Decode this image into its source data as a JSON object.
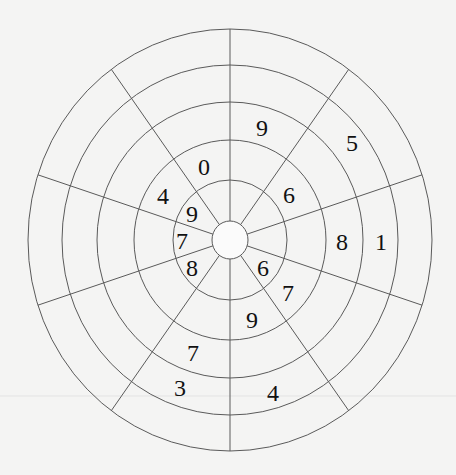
{
  "diagram": {
    "center": {
      "x": 230,
      "y": 240
    },
    "colors": {
      "background": "#f4f4f3",
      "lines": "#5a5a5a",
      "text": "#111111"
    },
    "hub": {
      "rx": 18,
      "ry": 19
    },
    "rings": [
      {
        "rx": 57,
        "ry": 60
      },
      {
        "rx": 96,
        "ry": 100
      },
      {
        "rx": 133,
        "ry": 138
      },
      {
        "rx": 168,
        "ry": 175
      },
      {
        "rx": 202,
        "ry": 211
      }
    ],
    "spoke_angles_deg": [
      90,
      126,
      162,
      198,
      234,
      270,
      306,
      342,
      18,
      54
    ],
    "numbers": [
      {
        "value": "9",
        "x": 262,
        "y": 128
      },
      {
        "value": "5",
        "x": 352,
        "y": 143
      },
      {
        "value": "0",
        "x": 204,
        "y": 167
      },
      {
        "value": "4",
        "x": 163,
        "y": 196
      },
      {
        "value": "6",
        "x": 289,
        "y": 195
      },
      {
        "value": "9",
        "x": 192,
        "y": 214
      },
      {
        "value": "7",
        "x": 182,
        "y": 241
      },
      {
        "value": "8",
        "x": 342,
        "y": 242
      },
      {
        "value": "1",
        "x": 381,
        "y": 242
      },
      {
        "value": "8",
        "x": 192,
        "y": 268
      },
      {
        "value": "6",
        "x": 263,
        "y": 268
      },
      {
        "value": "7",
        "x": 288,
        "y": 293
      },
      {
        "value": "9",
        "x": 252,
        "y": 320
      },
      {
        "value": "7",
        "x": 193,
        "y": 353
      },
      {
        "value": "3",
        "x": 180,
        "y": 388
      },
      {
        "value": "4",
        "x": 273,
        "y": 393
      }
    ]
  }
}
